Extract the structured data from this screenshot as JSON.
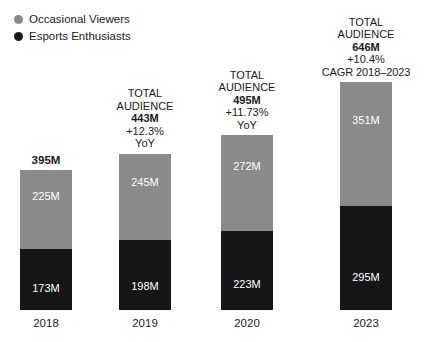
{
  "legend": {
    "items": [
      {
        "label": "Occasional Viewers",
        "color": "#8a8a8a",
        "icon": "circle-swatch-icon"
      },
      {
        "label": "Esports Enthusiasts",
        "color": "#1a1a1a",
        "icon": "circle-swatch-icon"
      }
    ]
  },
  "colors": {
    "occasional_viewers": "#8a8a8a",
    "esports_enthusiasts": "#161616",
    "background": "#ffffff",
    "text": "#1a1a1a",
    "value_label": "#ffffff"
  },
  "captions": [
    {
      "lines": [],
      "total_label": "395M",
      "simple": true
    },
    {
      "lines": [
        "TOTAL",
        "AUDIENCE"
      ],
      "total_label": "443M",
      "change": "+12.3%",
      "change_period": "YoY",
      "simple": false
    },
    {
      "lines": [
        "TOTAL",
        "AUDIENCE"
      ],
      "total_label": "495M",
      "change": "+11.73%",
      "change_period": "YoY",
      "simple": false
    },
    {
      "lines": [
        "TOTAL",
        "AUDIENCE"
      ],
      "total_label": "646M",
      "change": "+10.4%",
      "change_period": "CAGR 2018–2023",
      "simple": false
    }
  ],
  "chart_data": {
    "type": "bar",
    "subtype": "stacked-column",
    "title": "",
    "subtitle": "",
    "xlabel": "",
    "ylabel": "",
    "categories": [
      "2018",
      "2019",
      "2020",
      "2023"
    ],
    "series": [
      {
        "name": "Occasional Viewers",
        "color": "#8a8a8a",
        "values": [
          225,
          245,
          272,
          351
        ],
        "labels": [
          "225M",
          "245M",
          "272M",
          "351M"
        ]
      },
      {
        "name": "Esports Enthusiasts",
        "color": "#161616",
        "values": [
          173,
          198,
          223,
          295
        ],
        "labels": [
          "173M",
          "198M",
          "223M",
          "295M"
        ]
      }
    ],
    "totals": [
      395,
      443,
      495,
      646
    ],
    "total_labels": [
      "395M",
      "443M",
      "495M",
      "646M"
    ],
    "growth": [
      "",
      "+12.3%",
      "+11.73%",
      "+10.4%"
    ],
    "growth_period": [
      "",
      "YoY",
      "YoY",
      "CAGR 2018–2023"
    ],
    "unit": "M",
    "ylim": [
      0,
      646
    ],
    "grid": false,
    "legend_position": "top-left",
    "axis_visible": false
  },
  "geometry": {
    "bar_width_px": 52,
    "bar_lefts_px": [
      20,
      119,
      221,
      340
    ],
    "baseline_px": 310,
    "px_per_unit": 0.3529
  }
}
